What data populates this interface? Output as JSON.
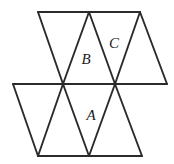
{
  "figure": {
    "kind": "triangle-net-diagram",
    "background_color": "#ffffff",
    "line_color": "#2b2b2b",
    "label_color": "#1a1a1a",
    "line_width": 1.9,
    "canvas": {
      "width": 174,
      "height": 164
    }
  },
  "labels": [
    {
      "id": "label-a",
      "text": "A",
      "x": 91,
      "y": 117
    },
    {
      "id": "label-b",
      "text": "B",
      "x": 86,
      "y": 61
    },
    {
      "id": "label-c",
      "text": "C",
      "x": 114,
      "y": 45
    }
  ],
  "geometry": {
    "rows": {
      "top_y": 12,
      "middle_y": 84,
      "bottom_y": 156
    },
    "top_row_span": {
      "x_start": 38,
      "x_end": 140
    },
    "middle_row_span": {
      "x_start": 13,
      "x_end": 167
    },
    "bottom_row_span": {
      "x_start": 38,
      "x_end": 142
    },
    "top_vertices": [
      38,
      89,
      140
    ],
    "middle_vertices": [
      13,
      63,
      115,
      167
    ],
    "bottom_vertices": [
      38,
      89,
      142
    ]
  },
  "edges": [
    {
      "name": "top-horizontal",
      "x1": 38,
      "y1": 12,
      "x2": 140,
      "y2": 12
    },
    {
      "name": "middle-horizontal",
      "x1": 13,
      "y1": 84,
      "x2": 167,
      "y2": 84
    },
    {
      "name": "bottom-horizontal",
      "x1": 38,
      "y1": 156,
      "x2": 142,
      "y2": 156
    },
    {
      "name": "top-left-down-right",
      "x1": 38,
      "y1": 12,
      "x2": 63,
      "y2": 84
    },
    {
      "name": "top-apex-down-left",
      "x1": 89,
      "y1": 12,
      "x2": 63,
      "y2": 84
    },
    {
      "name": "top-apex-down-right",
      "x1": 89,
      "y1": 12,
      "x2": 115,
      "y2": 84
    },
    {
      "name": "top-right-down-left",
      "x1": 140,
      "y1": 12,
      "x2": 115,
      "y2": 84
    },
    {
      "name": "top-right-down-right",
      "x1": 140,
      "y1": 12,
      "x2": 167,
      "y2": 84
    },
    {
      "name": "bottom-left-up-right",
      "x1": 13,
      "y1": 84,
      "x2": 38,
      "y2": 156
    },
    {
      "name": "bottom-mid-left-up",
      "x1": 63,
      "y1": 84,
      "x2": 38,
      "y2": 156
    },
    {
      "name": "bottom-mid-left-down",
      "x1": 63,
      "y1": 84,
      "x2": 89,
      "y2": 156
    },
    {
      "name": "bottom-mid-right-up",
      "x1": 115,
      "y1": 84,
      "x2": 89,
      "y2": 156
    },
    {
      "name": "bottom-mid-right-down",
      "x1": 115,
      "y1": 84,
      "x2": 142,
      "y2": 156
    }
  ]
}
